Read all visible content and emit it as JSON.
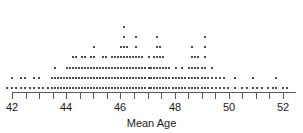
{
  "chart_data": {
    "type": "dotplot",
    "title": "",
    "xlabel": "Mean Age",
    "ylabel": "",
    "xlim": [
      41.7,
      52.2
    ],
    "grid": false,
    "legend": null,
    "tick_labels": [
      "42",
      "44",
      "46",
      "48",
      "50",
      "52"
    ],
    "major_ticks": [
      42,
      44,
      46,
      48,
      50,
      52
    ],
    "minor_ticks": [
      42.5,
      43,
      43.5,
      44.5,
      45,
      45.5,
      46.5,
      47,
      47.5,
      48.5,
      49,
      49.5,
      50.5,
      51,
      51.5
    ],
    "dot_color": "#4d4d4d",
    "axis_color": "#5a5a5a",
    "bin_width": 0.11,
    "stacks": [
      {
        "x": 41.78,
        "count": 1
      },
      {
        "x": 41.95,
        "count": 2
      },
      {
        "x": 42.12,
        "count": 1
      },
      {
        "x": 42.28,
        "count": 2
      },
      {
        "x": 42.45,
        "count": 2
      },
      {
        "x": 42.62,
        "count": 1
      },
      {
        "x": 42.78,
        "count": 2
      },
      {
        "x": 42.95,
        "count": 2
      },
      {
        "x": 43.1,
        "count": 1
      },
      {
        "x": 43.28,
        "count": 1
      },
      {
        "x": 43.45,
        "count": 2
      },
      {
        "x": 43.56,
        "count": 3
      },
      {
        "x": 43.67,
        "count": 2
      },
      {
        "x": 43.78,
        "count": 2
      },
      {
        "x": 43.9,
        "count": 2
      },
      {
        "x": 44.0,
        "count": 3
      },
      {
        "x": 44.11,
        "count": 3
      },
      {
        "x": 44.22,
        "count": 4
      },
      {
        "x": 44.33,
        "count": 4
      },
      {
        "x": 44.44,
        "count": 3
      },
      {
        "x": 44.55,
        "count": 4
      },
      {
        "x": 44.66,
        "count": 4
      },
      {
        "x": 44.77,
        "count": 3
      },
      {
        "x": 44.88,
        "count": 4
      },
      {
        "x": 45.0,
        "count": 5
      },
      {
        "x": 45.11,
        "count": 3
      },
      {
        "x": 45.22,
        "count": 3
      },
      {
        "x": 45.33,
        "count": 4
      },
      {
        "x": 45.44,
        "count": 4
      },
      {
        "x": 45.55,
        "count": 3
      },
      {
        "x": 45.66,
        "count": 4
      },
      {
        "x": 45.77,
        "count": 4
      },
      {
        "x": 45.88,
        "count": 4
      },
      {
        "x": 46.0,
        "count": 5
      },
      {
        "x": 46.11,
        "count": 7
      },
      {
        "x": 46.22,
        "count": 5
      },
      {
        "x": 46.33,
        "count": 4
      },
      {
        "x": 46.44,
        "count": 4
      },
      {
        "x": 46.55,
        "count": 6
      },
      {
        "x": 46.66,
        "count": 4
      },
      {
        "x": 46.77,
        "count": 4
      },
      {
        "x": 46.88,
        "count": 3
      },
      {
        "x": 47.0,
        "count": 4
      },
      {
        "x": 47.11,
        "count": 3
      },
      {
        "x": 47.22,
        "count": 4
      },
      {
        "x": 47.33,
        "count": 6
      },
      {
        "x": 47.44,
        "count": 5
      },
      {
        "x": 47.55,
        "count": 4
      },
      {
        "x": 47.66,
        "count": 3
      },
      {
        "x": 47.77,
        "count": 3
      },
      {
        "x": 47.9,
        "count": 2
      },
      {
        "x": 48.0,
        "count": 3
      },
      {
        "x": 48.12,
        "count": 2
      },
      {
        "x": 48.24,
        "count": 3
      },
      {
        "x": 48.36,
        "count": 2
      },
      {
        "x": 48.48,
        "count": 3
      },
      {
        "x": 48.6,
        "count": 5
      },
      {
        "x": 48.72,
        "count": 4
      },
      {
        "x": 48.84,
        "count": 4
      },
      {
        "x": 48.96,
        "count": 3
      },
      {
        "x": 49.08,
        "count": 6
      },
      {
        "x": 49.2,
        "count": 2
      },
      {
        "x": 49.34,
        "count": 3
      },
      {
        "x": 49.5,
        "count": 2
      },
      {
        "x": 49.62,
        "count": 2
      },
      {
        "x": 49.78,
        "count": 2
      },
      {
        "x": 49.92,
        "count": 1
      },
      {
        "x": 50.2,
        "count": 2
      },
      {
        "x": 50.45,
        "count": 1
      },
      {
        "x": 50.62,
        "count": 1
      },
      {
        "x": 50.85,
        "count": 2
      },
      {
        "x": 51.02,
        "count": 1
      },
      {
        "x": 51.2,
        "count": 1
      },
      {
        "x": 51.42,
        "count": 1
      },
      {
        "x": 51.58,
        "count": 1
      },
      {
        "x": 51.72,
        "count": 2
      },
      {
        "x": 51.95,
        "count": 1
      },
      {
        "x": 52.1,
        "count": 1
      }
    ]
  }
}
